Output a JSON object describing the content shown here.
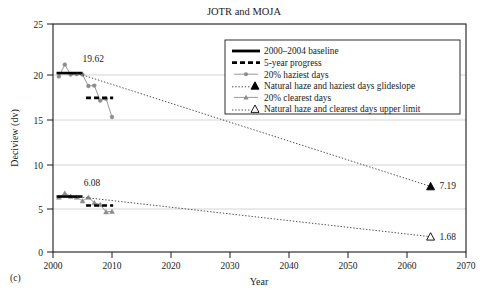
{
  "figure": {
    "panel_label": "(c)",
    "title": "JOTR and MOJA"
  },
  "chart_data": {
    "type": "line",
    "title": "JOTR and MOJA",
    "xlabel": "Year",
    "ylabel": "Deciview (dv)",
    "xlim": [
      2000,
      2070
    ],
    "ylim": [
      0,
      25
    ],
    "xticks": [
      2000,
      2010,
      2020,
      2030,
      2040,
      2050,
      2060,
      2070
    ],
    "yticks": [
      0,
      5,
      10,
      15,
      20,
      25
    ],
    "grid": "horizontal",
    "legend_position": "top-right",
    "annotations": [
      {
        "text": "19.62",
        "x": 2005.0,
        "y": 21.2,
        "name": "haziest-baseline-value"
      },
      {
        "text": "6.08",
        "x": 2005.2,
        "y": 7.6,
        "name": "clearest-baseline-value"
      },
      {
        "text": "7.19",
        "x": 2065.5,
        "y": 7.19,
        "name": "haziest-endpoint-value"
      },
      {
        "text": "1.68",
        "x": 2065.5,
        "y": 1.68,
        "name": "clearest-endpoint-value"
      }
    ],
    "series": [
      {
        "name": "20% haziest days",
        "style": "line-circle",
        "color": "#8c8c8c",
        "x": [
          2001,
          2002,
          2003,
          2004,
          2005,
          2006,
          2007,
          2008,
          2009,
          2010
        ],
        "values": [
          19.25,
          20.55,
          19.45,
          19.5,
          19.45,
          18.2,
          18.25,
          16.6,
          16.8,
          14.8
        ]
      },
      {
        "name": "20% clearest days",
        "style": "line-triangle",
        "color": "#8c8c8c",
        "x": [
          2001,
          2002,
          2003,
          2004,
          2005,
          2006,
          2007,
          2008,
          2009,
          2010
        ],
        "values": [
          6.0,
          6.45,
          6.1,
          6.0,
          5.6,
          6.0,
          5.4,
          5.2,
          4.4,
          4.45
        ]
      },
      {
        "name": "2000–2004 baseline",
        "style": "solid-thick",
        "color": "#000000",
        "segments": [
          {
            "x": [
              2000.6,
              2005.0
            ],
            "y": [
              19.62,
              19.62
            ]
          },
          {
            "x": [
              2000.6,
              2005.0
            ],
            "y": [
              6.08,
              6.08
            ]
          }
        ]
      },
      {
        "name": "5-year progress",
        "style": "dashed-thick",
        "color": "#000000",
        "segments": [
          {
            "x": [
              2005.6,
              2010.2
            ],
            "y": [
              16.9,
              16.9
            ]
          },
          {
            "x": [
              2005.6,
              2010.2
            ],
            "y": [
              5.1,
              5.1
            ]
          }
        ]
      },
      {
        "name": "Natural haze and haziest days glideslope",
        "style": "dotted-marker-filled",
        "color": "#3a3a3a",
        "x": [
          2004.0,
          2064.0
        ],
        "values": [
          19.62,
          7.19
        ]
      },
      {
        "name": "Natural haze and clearest days upper limit",
        "style": "dotted-marker-open",
        "color": "#3a3a3a",
        "x": [
          2004.0,
          2064.0
        ],
        "values": [
          6.08,
          1.68
        ]
      }
    ]
  },
  "legend": {
    "items": [
      {
        "label": "2000–2004 baseline",
        "style": "solid-thick"
      },
      {
        "label": "5-year progress",
        "style": "dashed-thick"
      },
      {
        "label": "20% haziest days",
        "style": "line-circle"
      },
      {
        "label": "Natural haze and haziest days glideslope",
        "style": "dotted-filled-triangle"
      },
      {
        "label": "20% clearest days",
        "style": "line-triangle"
      },
      {
        "label": "Natural haze and clearest days upper limit",
        "style": "dotted-open-triangle"
      }
    ]
  },
  "colors": {
    "axis": "#1a1a1a",
    "grid": "#c9c9c9",
    "marker_gray": "#8c8c8c",
    "black": "#000000"
  }
}
